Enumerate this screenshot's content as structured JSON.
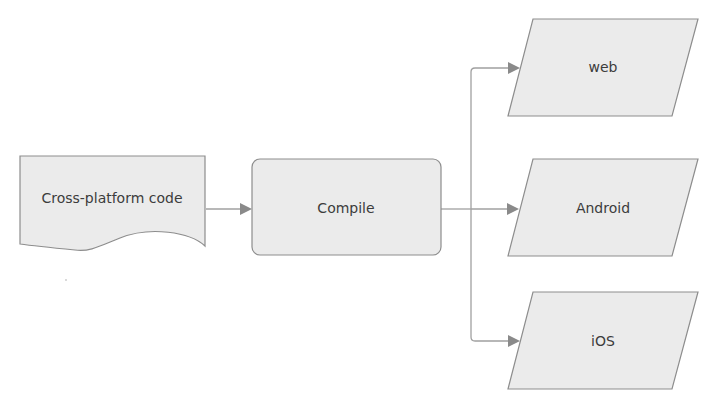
{
  "diagram": {
    "type": "flowchart",
    "direction": "left-to-right",
    "colors": {
      "node_fill": "#ebebeb",
      "node_stroke": "#8d8d8d",
      "edge_stroke": "#a0a0a0",
      "arrowhead": "#8a8a8a",
      "text": "#3c3c3c",
      "background": "#ffffff"
    },
    "nodes": [
      {
        "id": "source",
        "shape": "document",
        "label": "Cross-platform code"
      },
      {
        "id": "compile",
        "shape": "rounded-rectangle",
        "label": "Compile"
      },
      {
        "id": "web",
        "shape": "parallelogram",
        "label": "web"
      },
      {
        "id": "android",
        "shape": "parallelogram",
        "label": "Android"
      },
      {
        "id": "ios",
        "shape": "parallelogram",
        "label": "iOS"
      }
    ],
    "edges": [
      {
        "from": "source",
        "to": "compile"
      },
      {
        "from": "compile",
        "to": "web"
      },
      {
        "from": "compile",
        "to": "android"
      },
      {
        "from": "compile",
        "to": "ios"
      }
    ]
  }
}
